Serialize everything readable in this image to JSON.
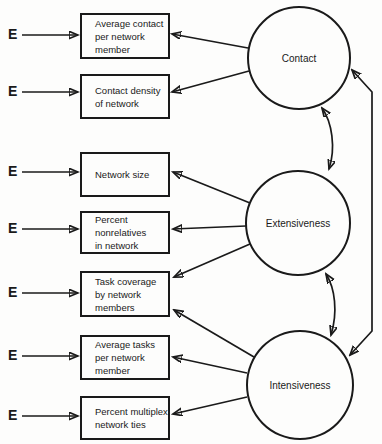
{
  "colors": {
    "ink": "#1a1a1a",
    "paper": "#fdfdfc"
  },
  "error_label": "E",
  "latent_variables": [
    {
      "label": "Contact"
    },
    {
      "label": "Extensiveness"
    },
    {
      "label": "Intensiveness"
    }
  ],
  "observed_variables": [
    {
      "label": "Average contact\nper network\nmember"
    },
    {
      "label": "Contact density\nof network"
    },
    {
      "label": "Network size"
    },
    {
      "label": "Percent\nnonrelatives\nin network"
    },
    {
      "label": "Task coverage\nby network\nmembers"
    },
    {
      "label": "Average tasks\nper network\nmember"
    },
    {
      "label": "Percent multiplex\nnetwork ties"
    }
  ],
  "loadings": [
    {
      "from": "Contact",
      "to": "Average contact per network member"
    },
    {
      "from": "Contact",
      "to": "Contact density of network"
    },
    {
      "from": "Extensiveness",
      "to": "Network size"
    },
    {
      "from": "Extensiveness",
      "to": "Percent nonrelatives in network"
    },
    {
      "from": "Extensiveness",
      "to": "Task coverage by network members"
    },
    {
      "from": "Intensiveness",
      "to": "Task coverage by network members"
    },
    {
      "from": "Intensiveness",
      "to": "Average tasks per network member"
    },
    {
      "from": "Intensiveness",
      "to": "Percent multiplex network ties"
    }
  ],
  "correlations": [
    {
      "between": [
        "Contact",
        "Extensiveness"
      ]
    },
    {
      "between": [
        "Extensiveness",
        "Intensiveness"
      ]
    },
    {
      "between": [
        "Contact",
        "Intensiveness"
      ]
    }
  ],
  "error_terms_count": 7
}
